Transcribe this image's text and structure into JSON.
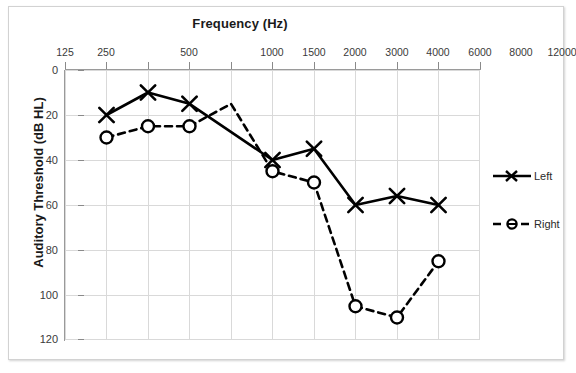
{
  "chart_data": {
    "type": "line",
    "title": "Frequency (Hz)",
    "xlabel": "Frequency (Hz)",
    "ylabel": "Auditory Threshold (dB HL)",
    "categories": [
      "125",
      "250",
      "500",
      "1000",
      "1500",
      "2000",
      "3000",
      "4000",
      "6000",
      "8000",
      "12000"
    ],
    "yticks": [
      "0",
      "20",
      "40",
      "60",
      "80",
      "100",
      "120"
    ],
    "ylim": [
      0,
      120
    ],
    "y_inverted": true,
    "grid": true,
    "legend_position": "right",
    "series": [
      {
        "name": "Left",
        "marker": "x",
        "linestyle": "solid",
        "color": "#000000",
        "x": [
          "250",
          "500",
          "1000",
          "2000",
          "3000",
          "4000",
          "6000",
          "8000"
        ],
        "values": [
          20,
          10,
          15,
          40,
          35,
          60,
          56,
          60
        ]
      },
      {
        "name": "Right",
        "marker": "circle",
        "linestyle": "dashed",
        "color": "#000000",
        "x": [
          "250",
          "500",
          "1000",
          "1500",
          "2000",
          "3000",
          "4000",
          "6000",
          "8000"
        ],
        "values": [
          30,
          25,
          25,
          15,
          45,
          50,
          105,
          110,
          85
        ]
      }
    ]
  },
  "legend": {
    "items": [
      {
        "label": "Left"
      },
      {
        "label": "Right"
      }
    ]
  },
  "colors": {
    "series": "#000000",
    "grid": "#d9d9d9",
    "axis": "#9a9a9a",
    "frame": "#d2d2d2",
    "text": "#1a1a1a",
    "background": "#ffffff"
  }
}
